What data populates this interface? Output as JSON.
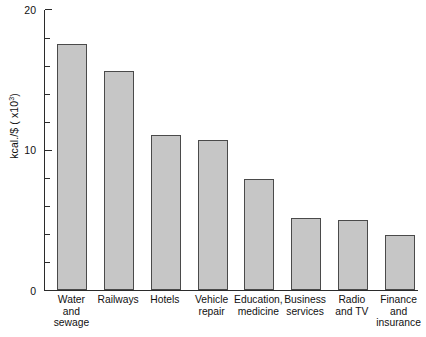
{
  "chart_data": {
    "type": "bar",
    "title": "",
    "subtitle": "",
    "xlabel": "",
    "ylabel": "kcal./$ ( x10",
    "ylabel_sup": "3",
    "ylabel_suffix": ")",
    "categories": [
      "Water\nand\nsewage",
      "Railways",
      "Hotels",
      "Vehicle\nrepair",
      "Education,\nmedicine",
      "Business\nservices",
      "Radio\nand TV",
      "Finance\nand\ninsurance"
    ],
    "values": [
      17.5,
      15.6,
      11.0,
      10.7,
      7.9,
      5.1,
      5.0,
      3.9
    ],
    "ylim": [
      0,
      20
    ],
    "y_major_ticks": [
      0,
      10,
      20
    ],
    "y_major_tick_labels": [
      "0",
      "10",
      "20"
    ],
    "y_minor_tick_step": 2,
    "y_minor_ticks": [
      2,
      4,
      6,
      8,
      12,
      14,
      16,
      18
    ],
    "grid": false,
    "legend": false,
    "legend_position": "none",
    "bar_fill_color": "#c6c6c6",
    "bar_edge_color": "#4a4a4a",
    "axis_color": "#2b2b2b",
    "background_color": "#ffffff"
  }
}
